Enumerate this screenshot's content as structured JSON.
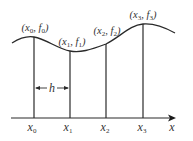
{
  "diagram": {
    "type": "interpolation-points",
    "stroke_color": "#2a2a2a",
    "axis": {
      "label": "x"
    },
    "spacing": {
      "label": "h"
    },
    "points": [
      {
        "x_label": "x",
        "x_sub": "0",
        "pt_open": "(x",
        "pt_sub1": "0",
        "pt_mid": ", f",
        "pt_sub2": "0",
        "pt_close": ")"
      },
      {
        "x_label": "x",
        "x_sub": "1",
        "pt_open": "(x",
        "pt_sub1": "1",
        "pt_mid": ", f",
        "pt_sub2": "1",
        "pt_close": ")"
      },
      {
        "x_label": "x",
        "x_sub": "2",
        "pt_open": "(x",
        "pt_sub1": "2",
        "pt_mid": ", f",
        "pt_sub2": "2",
        "pt_close": ")"
      },
      {
        "x_label": "x",
        "x_sub": "3",
        "pt_open": "(x",
        "pt_sub1": "3",
        "pt_mid": ", f",
        "pt_sub2": "3",
        "pt_close": ")"
      }
    ]
  }
}
